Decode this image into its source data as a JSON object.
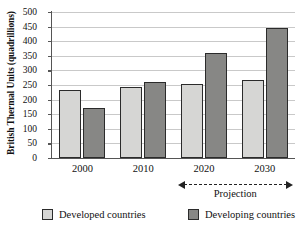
{
  "chart_data": {
    "type": "bar",
    "title": "",
    "xlabel": "",
    "ylabel": "British Thermal Units (quadrillions)",
    "ylim": [
      0,
      500
    ],
    "ytick_step": 50,
    "yticks": [
      "500",
      "450",
      "400",
      "350",
      "300",
      "250",
      "200",
      "150",
      "100",
      "50",
      "0"
    ],
    "grid": true,
    "legend_position": "bottom",
    "categories": [
      "2000",
      "2010",
      "2020",
      "2030"
    ],
    "series": [
      {
        "name": "Developed countries",
        "color": "#d6d6d4",
        "values": [
          232,
          243,
          252,
          267
        ]
      },
      {
        "name": "Developing countries",
        "color": "#878785",
        "values": [
          170,
          260,
          360,
          445
        ]
      }
    ],
    "annotations": [
      {
        "text": "Projection",
        "type": "double-headed-dashed-arrow",
        "spans_categories": [
          "2020",
          "2030"
        ]
      }
    ]
  },
  "legend": {
    "items": [
      {
        "label": "Developed countries",
        "swatch": "developed"
      },
      {
        "label": "Developing countries",
        "swatch": "developing"
      }
    ]
  },
  "annotation": {
    "projection_label": "Projection"
  }
}
